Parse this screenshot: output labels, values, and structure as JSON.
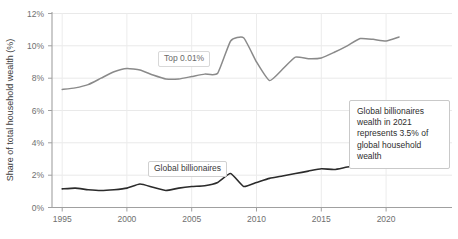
{
  "chart_data": {
    "type": "line",
    "title": "",
    "xlabel": "",
    "ylabel": "Share of total household wealth (%)",
    "xlim": [
      1995,
      2021
    ],
    "ylim": [
      0,
      12
    ],
    "grid": true,
    "legend_position": "inline-labels",
    "x_ticks": [
      "1995",
      "2000",
      "2005",
      "2010",
      "2015",
      "2020"
    ],
    "x_tick_values": [
      1995,
      2000,
      2005,
      2010,
      2015,
      2020
    ],
    "y_ticks": [
      "0%",
      "2%",
      "4%",
      "6%",
      "8%",
      "10%",
      "12%"
    ],
    "y_tick_values": [
      0,
      2,
      4,
      6,
      8,
      10,
      12
    ],
    "x": [
      1995,
      1996,
      1997,
      1998,
      1999,
      2000,
      2001,
      2002,
      2003,
      2004,
      2005,
      2006,
      2007,
      2008,
      2009,
      2010,
      2011,
      2012,
      2013,
      2014,
      2015,
      2016,
      2017,
      2018,
      2019,
      2020,
      2021
    ],
    "series": [
      {
        "name": "Top 0.01%",
        "color": "#8a8a8a",
        "values": [
          7.3,
          7.4,
          7.6,
          8.0,
          8.4,
          8.6,
          8.5,
          8.2,
          7.95,
          7.95,
          8.1,
          8.25,
          8.3,
          10.3,
          10.5,
          9.0,
          7.85,
          8.55,
          9.3,
          9.2,
          9.25,
          9.6,
          10.0,
          10.45,
          10.4,
          10.3,
          10.55
        ],
        "label": "Top 0.01%"
      },
      {
        "name": "Global billionaires",
        "color": "#2b2b2b",
        "values": [
          1.15,
          1.2,
          1.1,
          1.05,
          1.1,
          1.2,
          1.45,
          1.25,
          1.05,
          1.2,
          1.3,
          1.35,
          1.55,
          2.1,
          1.3,
          1.55,
          1.8,
          1.95,
          2.1,
          2.25,
          2.4,
          2.35,
          2.5,
          2.6,
          2.5,
          2.45,
          3.2
        ],
        "label": "Global billionaires"
      }
    ],
    "annotations": [
      {
        "id": "billionaires-2021-callout",
        "text": "Global billionaires wealth in 2021 represents 3.5% of global household wealth"
      }
    ]
  },
  "axis": {
    "y_label": "Share of total household wealth (%)",
    "y_tick_0": "0%",
    "y_tick_1": "2%",
    "y_tick_2": "4%",
    "y_tick_3": "6%",
    "y_tick_4": "8%",
    "y_tick_5": "10%",
    "y_tick_6": "12%",
    "x_tick_0": "1995",
    "x_tick_1": "2000",
    "x_tick_2": "2005",
    "x_tick_3": "2010",
    "x_tick_4": "2015",
    "x_tick_5": "2020"
  },
  "labels": {
    "top_series_tag": "Top 0.01%",
    "billionaires_series_tag": "Global billionaires",
    "callout": "Global billionaires wealth in 2021 represents 3.5% of global household wealth"
  },
  "colors": {
    "top_series": "#8a8a8a",
    "billionaires_series": "#2b2b2b",
    "grid": "#e8e8e8",
    "axis": "#999999",
    "tick_text": "#6f6f6f",
    "background": "#ffffff"
  }
}
